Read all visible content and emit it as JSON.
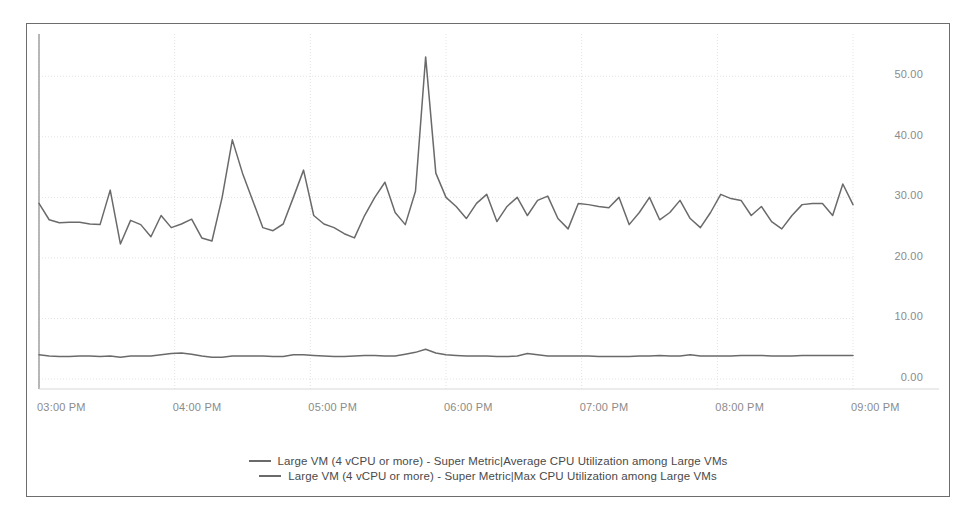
{
  "chart_data": {
    "type": "line",
    "title": "",
    "subtitle": "",
    "xlabel": "",
    "ylabel": "",
    "xlim": [
      "03:00 PM",
      "09:00 PM"
    ],
    "ylim": [
      0,
      55
    ],
    "y_ticks": [
      0,
      10,
      20,
      30,
      40,
      50
    ],
    "y_tick_labels": [
      "0.00",
      "10.00",
      "20.00",
      "30.00",
      "40.00",
      "50.00"
    ],
    "x_ticks": [
      0,
      1,
      2,
      3,
      4,
      5,
      6
    ],
    "x_tick_labels": [
      "03:00 PM",
      "04:00 PM",
      "05:00 PM",
      "06:00 PM",
      "07:00 PM",
      "08:00 PM",
      "09:00 PM"
    ],
    "grid": true,
    "grid_style": "dotted",
    "grid_color": "#e3e3e3",
    "legend_position": "bottom",
    "line_color": "#6a6a6a",
    "background_color": "#ffffff",
    "border_color": "#6d6d6d",
    "x_start_hours": 15.0,
    "x_end_hours": 21.0,
    "sample_interval_minutes": 5,
    "series": [
      {
        "name": "Large VM (4 vCPU or more) - Super Metric|Max CPU Utilization among Large VMs",
        "color": "#6a6a6a",
        "values": [
          29.0,
          26.3,
          25.8,
          25.9,
          25.9,
          25.6,
          25.5,
          31.2,
          22.3,
          26.2,
          25.5,
          23.5,
          27.0,
          25.0,
          25.6,
          26.4,
          23.3,
          22.8,
          30.0,
          39.5,
          34.0,
          29.5,
          25.0,
          24.5,
          25.6,
          30.0,
          34.5,
          27.0,
          25.6,
          25.0,
          24.0,
          23.3,
          27.0,
          30.0,
          32.5,
          27.5,
          25.5,
          31.0,
          53.2,
          34.0,
          30.0,
          28.5,
          26.5,
          29.0,
          30.5,
          26.0,
          28.5,
          30.0,
          27.0,
          29.5,
          30.2,
          26.5,
          24.8,
          29.0,
          28.8,
          28.5,
          28.3,
          30.0,
          25.5,
          27.5,
          30.0,
          26.3,
          27.5,
          29.5,
          26.5,
          25.0,
          27.5,
          30.5,
          29.8,
          29.5,
          27.0,
          28.5,
          26.0,
          24.8,
          27.0,
          28.8,
          29.0,
          29.0,
          27.0,
          32.2,
          28.8
        ]
      },
      {
        "name": "Large VM (4 vCPU or more) - Super Metric|Average CPU Utilization among Large VMs",
        "color": "#6a6a6a",
        "values": [
          4.0,
          3.8,
          3.7,
          3.7,
          3.8,
          3.8,
          3.7,
          3.8,
          3.6,
          3.8,
          3.8,
          3.8,
          4.0,
          4.2,
          4.3,
          4.1,
          3.8,
          3.6,
          3.6,
          3.8,
          3.8,
          3.8,
          3.8,
          3.7,
          3.7,
          4.0,
          4.0,
          3.9,
          3.8,
          3.7,
          3.7,
          3.8,
          3.9,
          3.9,
          3.8,
          3.8,
          4.1,
          4.4,
          4.9,
          4.3,
          4.0,
          3.9,
          3.8,
          3.8,
          3.8,
          3.7,
          3.7,
          3.8,
          4.2,
          4.0,
          3.8,
          3.8,
          3.8,
          3.8,
          3.8,
          3.7,
          3.7,
          3.7,
          3.7,
          3.8,
          3.8,
          3.9,
          3.8,
          3.8,
          4.0,
          3.8,
          3.8,
          3.8,
          3.8,
          3.9,
          3.9,
          3.9,
          3.8,
          3.8,
          3.8,
          3.9,
          3.9,
          3.9,
          3.9,
          3.9,
          3.9
        ]
      }
    ]
  },
  "legend": {
    "entries": [
      {
        "label": "Large VM (4 vCPU or more) - Super Metric|Average CPU Utilization among Large VMs"
      },
      {
        "label": "Large VM (4 vCPU or more) - Super Metric|Max CPU Utilization among Large VMs"
      }
    ]
  }
}
